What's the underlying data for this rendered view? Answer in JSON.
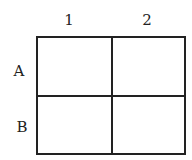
{
  "columns": [
    "1",
    "2"
  ],
  "rows": [
    "A",
    "B"
  ],
  "cells": [
    [
      "",
      ""
    ],
    [
      "",
      ""
    ]
  ]
}
